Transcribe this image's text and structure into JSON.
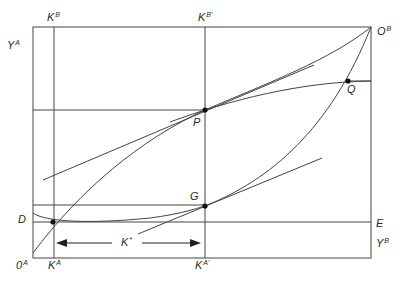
{
  "diagram": {
    "type": "edgeworth-box",
    "labels": {
      "YA": {
        "base": "Y",
        "sup": "A"
      },
      "KB": {
        "base": "K",
        "sup": "B"
      },
      "KBprime": {
        "base": "K",
        "sup": "B'"
      },
      "OB": {
        "base": "O",
        "sup": "B"
      },
      "Q": {
        "base": "Q",
        "sup": ""
      },
      "P": {
        "base": "P",
        "sup": ""
      },
      "G": {
        "base": "G",
        "sup": ""
      },
      "D": {
        "base": "D",
        "sup": ""
      },
      "E": {
        "base": "E",
        "sup": ""
      },
      "YB": {
        "base": "Y",
        "sup": "B"
      },
      "OA": {
        "base": "0",
        "sup": "A"
      },
      "KA": {
        "base": "K",
        "sup": "A"
      },
      "KAprime": {
        "base": "K",
        "sup": "A'"
      },
      "Kstar": {
        "base": "K",
        "sup": "*"
      }
    },
    "points": [
      {
        "name": "P",
        "x": 205,
        "y": 110
      },
      {
        "name": "Q",
        "x": 348,
        "y": 81
      },
      {
        "name": "G",
        "x": 205,
        "y": 206
      },
      {
        "name": "D-intersection",
        "x": 53,
        "y": 222
      }
    ],
    "stroke_color": "#3a3a3a"
  }
}
